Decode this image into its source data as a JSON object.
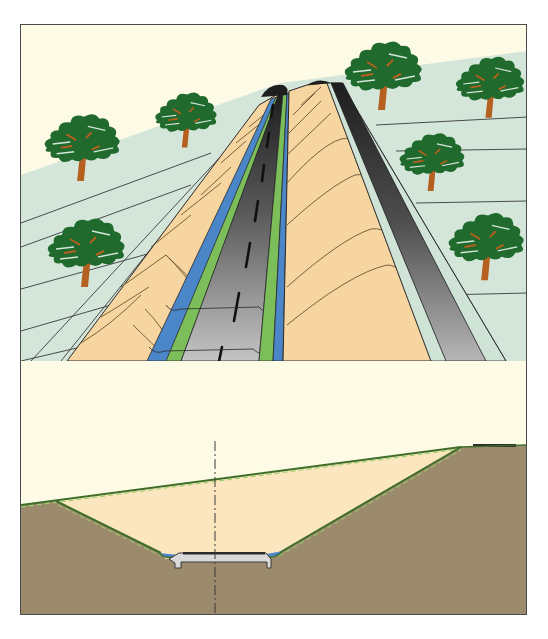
{
  "diagram": {
    "title": "",
    "labels": [],
    "colors": {
      "sky": "#fdfbe6",
      "ground_surface": "#d4e6da",
      "cut_slope": "#f6d5a0",
      "road_asphalt_dark": "#2a2a2a",
      "road_asphalt_light": "#b9b9b9",
      "verge_blue": "#4a86c8",
      "verge_green": "#7cbf5a",
      "tree_foliage": "#1f6a2c",
      "tree_trunk": "#b5601e",
      "soil": "#9c8a6c",
      "excavated_area": "#fbe6bf",
      "topsoil_line": "#4a7a32",
      "frame_border": "#4a4a4a"
    },
    "panels": [
      {
        "name": "perspective-view",
        "elements": [
          "trees",
          "cut-slopes",
          "road-with-centre-line",
          "verges",
          "upper-road"
        ]
      },
      {
        "name": "cross-section",
        "elements": [
          "natural-ground-line",
          "excavation",
          "road-slab",
          "drainage-channels",
          "centre-line-axis",
          "upper-road-surface"
        ]
      }
    ]
  }
}
